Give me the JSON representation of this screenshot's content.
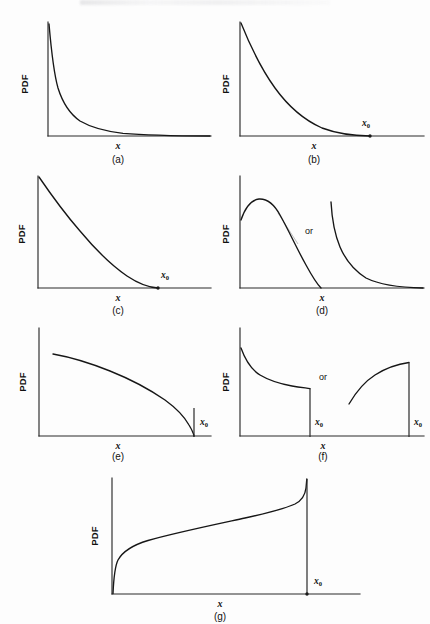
{
  "figure": {
    "background_color": "#fdfdfd",
    "ink_color": "#161616",
    "ghost_color": "#b8b8b8",
    "header_artifact": ""
  },
  "labels": {
    "y_axis": "PDF",
    "x_axis": "x",
    "x_limit": "x",
    "x_limit_subscript": "0",
    "alternative": "or"
  },
  "panels": [
    {
      "id": "a",
      "caption": "(a)",
      "y_label": "PDF",
      "x_label": "x",
      "shape": "unbounded-hyperbolic-decay",
      "has_x0": false,
      "has_or": false,
      "subplots": 1
    },
    {
      "id": "b",
      "caption": "(b)",
      "y_label": "PDF",
      "x_label": "x",
      "shape": "exponential-decay-to-x0",
      "has_x0": true,
      "x0_label": "x",
      "x0_subscript": "0",
      "has_or": false,
      "subplots": 1
    },
    {
      "id": "c",
      "caption": "(c)",
      "y_label": "PDF",
      "x_label": "x",
      "shape": "convex-decay-touching-x0",
      "has_x0": true,
      "x0_label": "x",
      "x0_subscript": "0",
      "has_or": false,
      "subplots": 1
    },
    {
      "id": "d",
      "caption": "(d)",
      "y_label": "PDF",
      "x_label": "x",
      "shape": "unimodal-hump-or-steep-decay",
      "has_x0": false,
      "has_or": true,
      "or_label": "or",
      "subplots": 2
    },
    {
      "id": "e",
      "caption": "(e)",
      "y_label": "PDF",
      "x_label": "x",
      "shape": "slow-decline-sharp-drop-at-x0",
      "has_x0": true,
      "x0_label": "x",
      "x0_subscript": "0",
      "has_or": false,
      "subplots": 1
    },
    {
      "id": "f",
      "caption": "(f)",
      "y_label": "PDF",
      "x_label": "x",
      "shape": "truncated-decay-or-truncated-rise",
      "has_x0": true,
      "x0_label": "x",
      "x0_subscript": "0",
      "has_or": true,
      "or_label": "or",
      "subplots": 2
    },
    {
      "id": "g",
      "caption": "(g)",
      "y_label": "PDF",
      "x_label": "x",
      "shape": "rising-asymptote-at-x0",
      "has_x0": true,
      "x0_label": "x",
      "x0_subscript": "0",
      "has_or": false,
      "subplots": 1
    }
  ],
  "chart_data": {
    "type": "line",
    "title": "",
    "xlabel": "x",
    "ylabel": "PDF",
    "grid": false,
    "legend": "none",
    "axis_ticks": "none",
    "note": "Seven schematic probability density function shapes, panels (a) through (g). Curves are qualitative sketches with unlabeled axes; x0 marks an upper bound where shown.",
    "charts": [
      {
        "panel": "a",
        "caption": "(a)",
        "xlim": [
          0,
          1
        ],
        "ylim": [
          0,
          1
        ],
        "series": [
          {
            "name": "hyperbolic-decay",
            "x": [
              0.0,
              0.02,
              0.05,
              0.09,
              0.14,
              0.2,
              0.28,
              0.38,
              0.5,
              0.64,
              0.8,
              1.0
            ],
            "values": [
              1.0,
              0.72,
              0.46,
              0.31,
              0.22,
              0.16,
              0.12,
              0.09,
              0.065,
              0.05,
              0.035,
              0.025
            ]
          }
        ]
      },
      {
        "panel": "b",
        "caption": "(b)",
        "xlim": [
          0,
          1
        ],
        "ylim": [
          0,
          1
        ],
        "x0": 0.8,
        "series": [
          {
            "name": "exponential-decay",
            "x": [
              0.0,
              0.1,
              0.2,
              0.3,
              0.4,
              0.5,
              0.6,
              0.7,
              0.8,
              0.9,
              1.0
            ],
            "values": [
              1.0,
              0.74,
              0.54,
              0.39,
              0.27,
              0.18,
              0.11,
              0.06,
              0.025,
              0.008,
              0.0
            ]
          }
        ]
      },
      {
        "panel": "c",
        "caption": "(c)",
        "xlim": [
          0,
          1
        ],
        "ylim": [
          0,
          1
        ],
        "x0": 0.76,
        "series": [
          {
            "name": "convex-decay",
            "x": [
              0.0,
              0.1,
              0.2,
              0.3,
              0.4,
              0.5,
              0.6,
              0.7,
              0.76,
              0.85,
              1.0
            ],
            "values": [
              1.0,
              0.84,
              0.68,
              0.53,
              0.38,
              0.25,
              0.13,
              0.04,
              0.0,
              0.0,
              0.0
            ]
          }
        ]
      },
      {
        "panel": "d",
        "caption": "(d)",
        "xlim": [
          0,
          1
        ],
        "ylim": [
          0,
          1
        ],
        "series": [
          {
            "name": "unimodal-hump",
            "x": [
              0.0,
              0.04,
              0.09,
              0.14,
              0.2,
              0.26,
              0.32,
              0.38,
              0.44,
              0.5
            ],
            "values": [
              0.62,
              0.76,
              0.82,
              0.8,
              0.7,
              0.56,
              0.4,
              0.24,
              0.1,
              0.0
            ]
          },
          {
            "name": "steep-decay",
            "x": [
              0.56,
              0.58,
              0.62,
              0.68,
              0.74,
              0.82,
              0.9,
              1.0
            ],
            "values": [
              0.82,
              0.52,
              0.3,
              0.18,
              0.12,
              0.07,
              0.04,
              0.02
            ]
          }
        ]
      },
      {
        "panel": "e",
        "caption": "(e)",
        "xlim": [
          0,
          1
        ],
        "ylim": [
          0,
          1
        ],
        "x0": 0.93,
        "series": [
          {
            "name": "slow-decline",
            "x": [
              0.1,
              0.2,
              0.3,
              0.4,
              0.5,
              0.6,
              0.7,
              0.8,
              0.88,
              0.92,
              0.93
            ],
            "values": [
              0.78,
              0.73,
              0.68,
              0.62,
              0.56,
              0.49,
              0.41,
              0.31,
              0.2,
              0.08,
              0.0
            ]
          }
        ]
      },
      {
        "panel": "f",
        "caption": "(f)",
        "xlim": [
          0,
          1
        ],
        "ylim": [
          0,
          1
        ],
        "x0_left": 0.4,
        "x0_right": 0.95,
        "series": [
          {
            "name": "truncated-decay",
            "x": [
              0.02,
              0.06,
              0.11,
              0.17,
              0.24,
              0.31,
              0.4
            ],
            "values": [
              0.86,
              0.62,
              0.49,
              0.42,
              0.37,
              0.34,
              0.32
            ]
          },
          {
            "name": "truncated-rise",
            "x": [
              0.58,
              0.63,
              0.69,
              0.76,
              0.84,
              0.92,
              0.95
            ],
            "values": [
              0.28,
              0.42,
              0.53,
              0.6,
              0.65,
              0.68,
              0.69
            ]
          }
        ]
      },
      {
        "panel": "g",
        "caption": "(g)",
        "xlim": [
          0,
          1
        ],
        "ylim": [
          0,
          1
        ],
        "x0": 0.9,
        "series": [
          {
            "name": "rising-asymptote",
            "x": [
              0.0,
              0.01,
              0.03,
              0.07,
              0.14,
              0.24,
              0.36,
              0.5,
              0.64,
              0.76,
              0.85,
              0.89,
              0.9
            ],
            "values": [
              0.0,
              0.22,
              0.33,
              0.4,
              0.46,
              0.52,
              0.57,
              0.62,
              0.67,
              0.73,
              0.81,
              0.92,
              1.0
            ]
          }
        ]
      }
    ]
  }
}
